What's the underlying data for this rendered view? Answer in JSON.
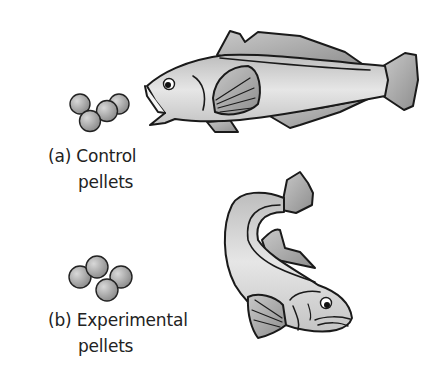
{
  "figure": {
    "panel_a": {
      "marker": "(a)",
      "line1": "Control",
      "line2": "pellets",
      "subject": "fish-eating-pellets"
    },
    "panel_b": {
      "marker": "(b)",
      "line1": "Experimental",
      "line2": "pellets",
      "subject": "fish-turning-away"
    }
  },
  "colors": {
    "outline": "#1a1a1a",
    "body_fill": "#d4d4d4",
    "fin_fill": "#a8a8a8",
    "pellet_fill": "#a0a0a0"
  }
}
